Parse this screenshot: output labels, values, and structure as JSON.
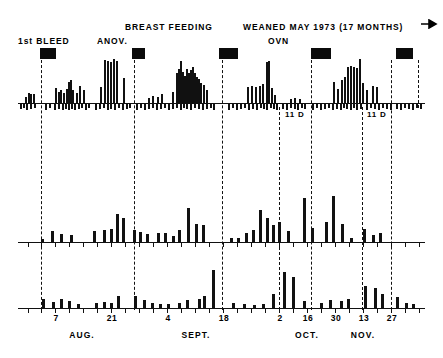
{
  "figure": {
    "title_annotations": [
      {
        "text": "1st BLEED",
        "x": 18,
        "y": 36
      },
      {
        "text": "ANOV.",
        "x": 97,
        "y": 36
      },
      {
        "text": "BREAST FEEDING",
        "x": 125,
        "y": 22
      },
      {
        "text": "WEANED MAY 1973 (17 MONTHS)",
        "x": 243,
        "y": 22
      },
      {
        "text": "OVN",
        "x": 268,
        "y": 36
      }
    ],
    "arrow": {
      "name": "right-arrow-icon",
      "x": 421,
      "y": 19,
      "width": 18,
      "height": 10
    },
    "event_bars": [
      {
        "x": 40,
        "y": 48,
        "w": 16,
        "h": 11
      },
      {
        "x": 132,
        "y": 48,
        "w": 13,
        "h": 11
      },
      {
        "x": 219,
        "y": 48,
        "w": 19,
        "h": 11
      },
      {
        "x": 311,
        "y": 48,
        "w": 20,
        "h": 11
      },
      {
        "x": 396,
        "y": 48,
        "w": 17,
        "h": 11
      }
    ],
    "cycle_dividers": [
      {
        "x": 40.5,
        "y": 60,
        "h": 250
      },
      {
        "x": 133.5,
        "y": 60,
        "h": 250
      },
      {
        "x": 221.5,
        "y": 60,
        "h": 250
      },
      {
        "x": 278.5,
        "y": 107,
        "h": 203
      },
      {
        "x": 310.5,
        "y": 60,
        "h": 250
      },
      {
        "x": 361.5,
        "y": 107,
        "h": 203
      },
      {
        "x": 390.5,
        "y": 60,
        "h": 250
      },
      {
        "x": 417.5,
        "y": 60,
        "h": 48
      }
    ],
    "annotations_below_panel1": [
      {
        "text": "11  D",
        "x": 285,
        "y": 110
      },
      {
        "text": "11  D",
        "x": 367,
        "y": 110
      }
    ],
    "panel1": {
      "name": "panel-hormone-spikes",
      "baseline_y": 103,
      "x0": 18,
      "x1": 425,
      "max_spike_h": 44,
      "spikes": [
        [
          25,
          6
        ],
        [
          28,
          10
        ],
        [
          30,
          9
        ],
        [
          33,
          9
        ],
        [
          55,
          15
        ],
        [
          58,
          11
        ],
        [
          60,
          13
        ],
        [
          63,
          10
        ],
        [
          66,
          14
        ],
        [
          68,
          21
        ],
        [
          70,
          23
        ],
        [
          72,
          13
        ],
        [
          76,
          10
        ],
        [
          79,
          17
        ],
        [
          83,
          13
        ],
        [
          100,
          16
        ],
        [
          104,
          43
        ],
        [
          107,
          42
        ],
        [
          110,
          41
        ],
        [
          113,
          44
        ],
        [
          116,
          42
        ],
        [
          123,
          25
        ],
        [
          148,
          5
        ],
        [
          152,
          7
        ],
        [
          157,
          6
        ],
        [
          161,
          9
        ],
        [
          172,
          11
        ],
        [
          176,
          30
        ],
        [
          178,
          34
        ],
        [
          180,
          42
        ],
        [
          182,
          31
        ],
        [
          184,
          27
        ],
        [
          186,
          34
        ],
        [
          188,
          30
        ],
        [
          190,
          33
        ],
        [
          192,
          36
        ],
        [
          194,
          30
        ],
        [
          196,
          26
        ],
        [
          198,
          24
        ],
        [
          200,
          20
        ],
        [
          203,
          18
        ],
        [
          206,
          13
        ],
        [
          247,
          16
        ],
        [
          251,
          17
        ],
        [
          255,
          16
        ],
        [
          259,
          17
        ],
        [
          262,
          19
        ],
        [
          266,
          41
        ],
        [
          268,
          42
        ],
        [
          271,
          15
        ],
        [
          274,
          8
        ],
        [
          290,
          4
        ],
        [
          294,
          5
        ],
        [
          299,
          4
        ],
        [
          333,
          21
        ],
        [
          337,
          14
        ],
        [
          341,
          23
        ],
        [
          344,
          26
        ],
        [
          347,
          36
        ],
        [
          350,
          37
        ],
        [
          353,
          36
        ],
        [
          356,
          35
        ],
        [
          359,
          44
        ],
        [
          362,
          20
        ],
        [
          366,
          13
        ],
        [
          372,
          17
        ],
        [
          376,
          16
        ]
      ],
      "down_ticks": [
        [
          20,
          5
        ],
        [
          23,
          4
        ],
        [
          26,
          6
        ],
        [
          30,
          5
        ],
        [
          34,
          4
        ],
        [
          45,
          6
        ],
        [
          49,
          4
        ],
        [
          54,
          6
        ],
        [
          58,
          5
        ],
        [
          62,
          6
        ],
        [
          65,
          5
        ],
        [
          68,
          6
        ],
        [
          71,
          5
        ],
        [
          74,
          6
        ],
        [
          78,
          5
        ],
        [
          81,
          4
        ],
        [
          85,
          6
        ],
        [
          88,
          4
        ],
        [
          95,
          6
        ],
        [
          99,
          5
        ],
        [
          103,
          4
        ],
        [
          107,
          6
        ],
        [
          110,
          5
        ],
        [
          114,
          6
        ],
        [
          118,
          4
        ],
        [
          122,
          6
        ],
        [
          126,
          5
        ],
        [
          129,
          4
        ],
        [
          136,
          6
        ],
        [
          140,
          4
        ],
        [
          144,
          6
        ],
        [
          148,
          5
        ],
        [
          152,
          4
        ],
        [
          156,
          6
        ],
        [
          160,
          5
        ],
        [
          164,
          4
        ],
        [
          168,
          6
        ],
        [
          172,
          5
        ],
        [
          176,
          4
        ],
        [
          180,
          6
        ],
        [
          183,
          4
        ],
        [
          186,
          5
        ],
        [
          190,
          6
        ],
        [
          194,
          4
        ],
        [
          198,
          5
        ],
        [
          202,
          6
        ],
        [
          206,
          5
        ],
        [
          210,
          4
        ],
        [
          213,
          6
        ],
        [
          228,
          6
        ],
        [
          232,
          4
        ],
        [
          236,
          6
        ],
        [
          240,
          5
        ],
        [
          244,
          4
        ],
        [
          248,
          6
        ],
        [
          252,
          5
        ],
        [
          256,
          6
        ],
        [
          260,
          4
        ],
        [
          263,
          5
        ],
        [
          266,
          6
        ],
        [
          270,
          4
        ],
        [
          273,
          5
        ],
        [
          276,
          6
        ],
        [
          282,
          5
        ],
        [
          286,
          6
        ],
        [
          290,
          4
        ],
        [
          294,
          5
        ],
        [
          297,
          6
        ],
        [
          301,
          4
        ],
        [
          304,
          5
        ],
        [
          312,
          6
        ],
        [
          316,
          4
        ],
        [
          320,
          6
        ],
        [
          324,
          5
        ],
        [
          328,
          4
        ],
        [
          332,
          6
        ],
        [
          336,
          5
        ],
        [
          340,
          6
        ],
        [
          343,
          4
        ],
        [
          346,
          5
        ],
        [
          350,
          6
        ],
        [
          353,
          4
        ],
        [
          356,
          6
        ],
        [
          360,
          5
        ],
        [
          366,
          6
        ],
        [
          370,
          4
        ],
        [
          374,
          5
        ],
        [
          378,
          6
        ],
        [
          382,
          4
        ],
        [
          386,
          5
        ],
        [
          390,
          6
        ],
        [
          396,
          5
        ],
        [
          400,
          6
        ],
        [
          404,
          4
        ],
        [
          408,
          5
        ],
        [
          412,
          6
        ],
        [
          416,
          4
        ],
        [
          420,
          5
        ]
      ]
    },
    "panel2": {
      "name": "panel-steroid-bars",
      "baseline_y": 242,
      "x0": 18,
      "x1": 425,
      "max_bar_h": 62,
      "bars": [
        [
          41,
          3
        ],
        [
          51,
          11
        ],
        [
          60,
          8
        ],
        [
          70,
          7
        ],
        [
          93,
          11
        ],
        [
          103,
          12
        ],
        [
          110,
          13
        ],
        [
          116,
          28
        ],
        [
          122,
          24
        ],
        [
          133,
          12
        ],
        [
          139,
          10
        ],
        [
          146,
          8
        ],
        [
          157,
          9
        ],
        [
          164,
          9
        ],
        [
          172,
          6
        ],
        [
          178,
          12
        ],
        [
          187,
          34
        ],
        [
          195,
          18
        ],
        [
          202,
          17
        ],
        [
          230,
          4
        ],
        [
          237,
          4
        ],
        [
          245,
          9
        ],
        [
          252,
          12
        ],
        [
          259,
          32
        ],
        [
          266,
          24
        ],
        [
          272,
          17
        ],
        [
          278,
          20
        ],
        [
          287,
          11
        ],
        [
          303,
          44
        ],
        [
          311,
          14
        ],
        [
          325,
          20
        ],
        [
          332,
          46
        ],
        [
          341,
          18
        ],
        [
          350,
          4
        ],
        [
          363,
          13
        ],
        [
          372,
          7
        ],
        [
          379,
          9
        ]
      ],
      "axis_ticks": [
        28,
        41,
        55,
        69,
        83,
        97,
        111,
        125,
        139,
        153,
        167,
        181,
        195,
        209,
        223,
        237,
        251,
        265,
        279,
        293,
        307,
        321,
        335,
        349,
        363,
        377,
        391,
        405,
        419
      ]
    },
    "panel3": {
      "name": "panel-behaviour-bars",
      "baseline_y": 308,
      "x0": 18,
      "x1": 425,
      "max_bar_h": 40,
      "bars": [
        [
          42,
          9
        ],
        [
          52,
          6
        ],
        [
          60,
          9
        ],
        [
          68,
          7
        ],
        [
          77,
          4
        ],
        [
          95,
          5
        ],
        [
          103,
          6
        ],
        [
          110,
          5
        ],
        [
          117,
          12
        ],
        [
          134,
          12
        ],
        [
          143,
          8
        ],
        [
          151,
          5
        ],
        [
          159,
          4
        ],
        [
          167,
          4
        ],
        [
          178,
          5
        ],
        [
          186,
          8
        ],
        [
          198,
          9
        ],
        [
          203,
          12
        ],
        [
          212,
          38
        ],
        [
          232,
          5
        ],
        [
          243,
          4
        ],
        [
          253,
          3
        ],
        [
          262,
          4
        ],
        [
          272,
          14
        ],
        [
          283,
          36
        ],
        [
          292,
          31
        ],
        [
          303,
          7
        ],
        [
          320,
          5
        ],
        [
          329,
          8
        ],
        [
          340,
          7
        ],
        [
          347,
          9
        ],
        [
          364,
          22
        ],
        [
          374,
          20
        ],
        [
          381,
          14
        ],
        [
          396,
          11
        ],
        [
          405,
          5
        ],
        [
          412,
          4
        ]
      ],
      "axis_ticks": [
        28,
        41,
        55,
        69,
        83,
        97,
        111,
        125,
        139,
        153,
        167,
        181,
        195,
        209,
        223,
        237,
        251,
        265,
        279,
        293,
        307,
        321,
        335,
        349,
        363,
        377,
        391,
        405,
        419
      ]
    },
    "x_axis": {
      "day_labels": [
        {
          "text": "7",
          "x": 55
        },
        {
          "text": "21",
          "x": 111
        },
        {
          "text": "4",
          "x": 167
        },
        {
          "text": "18",
          "x": 223
        },
        {
          "text": "2",
          "x": 279
        },
        {
          "text": "16",
          "x": 307
        },
        {
          "text": "30",
          "x": 335
        },
        {
          "text": "13",
          "x": 363
        },
        {
          "text": "27",
          "x": 391
        }
      ],
      "month_labels": [
        {
          "text": "AUG.",
          "x": 82
        },
        {
          "text": "SEPT.",
          "x": 196
        },
        {
          "text": "OCT.",
          "x": 307
        },
        {
          "text": "NOV.",
          "x": 363
        }
      ],
      "day_label_y": 313,
      "month_label_y": 330
    }
  }
}
